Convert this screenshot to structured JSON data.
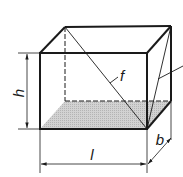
{
  "diagram": {
    "labels": {
      "height": "h",
      "length": "l",
      "width": "b",
      "face_diagonal": "f"
    },
    "colors": {
      "stroke": "#1a1a1a",
      "base_fill": "#c8c8c8",
      "background": "#ffffff"
    }
  }
}
